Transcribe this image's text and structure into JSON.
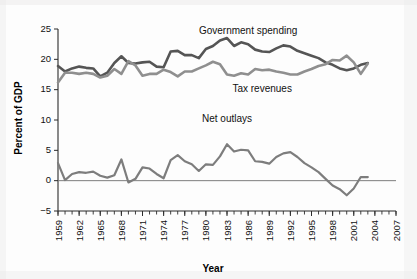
{
  "figure": {
    "background_color": "#fdfdfd",
    "series_colors": {
      "government_spending": "#555555",
      "tax_revenues": "#8f8f8f",
      "net_outlays": "#7d7d7d"
    },
    "axis_color": "#2b2b2b",
    "zero_line_color": "#7d7d7d"
  },
  "labels": {
    "government_spending": "Government spending",
    "tax_revenues": "Tax revenues",
    "net_outlays": "Net outlays",
    "xlabel": "Year",
    "ylabel": "Percent of GDP"
  },
  "axes": {
    "ytick_labels": [
      "25",
      "20",
      "15",
      "10",
      "5",
      "0",
      "−5"
    ],
    "ytick_values": [
      25,
      20,
      15,
      10,
      5,
      0,
      -5
    ],
    "xtick_labels": [
      "1959",
      "1962",
      "1965",
      "1968",
      "1971",
      "1974",
      "1977",
      "1980",
      "1983",
      "1986",
      "1989",
      "1992",
      "1995",
      "1998",
      "2001",
      "2004",
      "2007"
    ],
    "xtick_values": [
      1959,
      1962,
      1965,
      1968,
      1971,
      1974,
      1977,
      1980,
      1983,
      1986,
      1989,
      1992,
      1995,
      1998,
      2001,
      2004,
      2007
    ],
    "xlim": [
      1959,
      2007
    ],
    "ylim": [
      -5,
      25
    ],
    "minor_tick_step": 1
  },
  "chart_data": {
    "type": "line",
    "title": "",
    "xlabel": "Year",
    "ylabel": "Percent of GDP",
    "xlim": [
      1959,
      2007
    ],
    "ylim": [
      -5,
      25
    ],
    "grid": false,
    "legend_position": "inline-annotations",
    "x": [
      1959,
      1960,
      1961,
      1962,
      1963,
      1964,
      1965,
      1966,
      1967,
      1968,
      1969,
      1970,
      1971,
      1972,
      1973,
      1974,
      1975,
      1976,
      1977,
      1978,
      1979,
      1980,
      1981,
      1982,
      1983,
      1984,
      1985,
      1986,
      1987,
      1988,
      1989,
      1990,
      1991,
      1992,
      1993,
      1994,
      1995,
      1996,
      1997,
      1998,
      1999,
      2000,
      2001,
      2002,
      2003
    ],
    "series": [
      {
        "name": "Government spending",
        "color": "#555555",
        "values": [
          18.9,
          18.0,
          18.5,
          18.8,
          18.6,
          18.5,
          17.2,
          17.8,
          19.4,
          20.5,
          19.4,
          19.3,
          19.5,
          19.6,
          18.8,
          18.7,
          21.3,
          21.4,
          20.7,
          20.7,
          20.2,
          21.7,
          22.2,
          23.1,
          23.5,
          22.2,
          22.8,
          22.5,
          21.6,
          21.3,
          21.2,
          21.8,
          22.3,
          22.1,
          21.4,
          21.0,
          20.6,
          20.2,
          19.5,
          19.1,
          18.5,
          18.2,
          18.5,
          19.1,
          19.4
        ],
        "style": "solid",
        "linewidth": 2.6
      },
      {
        "name": "Tax revenues",
        "color": "#8f8f8f",
        "values": [
          16.2,
          17.8,
          17.8,
          17.6,
          17.8,
          17.6,
          17.0,
          17.3,
          18.4,
          17.6,
          19.7,
          19.0,
          17.3,
          17.6,
          17.6,
          18.3,
          17.9,
          17.2,
          18.0,
          18.0,
          18.5,
          19.0,
          19.6,
          19.2,
          17.5,
          17.3,
          17.7,
          17.5,
          18.4,
          18.2,
          18.3,
          18.0,
          17.8,
          17.5,
          17.5,
          18.0,
          18.4,
          18.9,
          19.2,
          19.9,
          19.8,
          20.6,
          19.5,
          17.6,
          19.3
        ],
        "style": "solid",
        "linewidth": 2.6
      },
      {
        "name": "Net outlays",
        "color": "#7d7d7d",
        "values": [
          2.9,
          0.1,
          1.1,
          1.4,
          1.3,
          1.5,
          0.8,
          0.5,
          0.9,
          3.5,
          -0.3,
          0.3,
          2.2,
          2.0,
          1.1,
          0.4,
          3.4,
          4.2,
          3.2,
          2.7,
          1.6,
          2.7,
          2.6,
          4.0,
          6.0,
          4.8,
          5.1,
          5.0,
          3.2,
          3.1,
          2.8,
          3.9,
          4.5,
          4.7,
          3.9,
          2.9,
          2.2,
          1.4,
          0.3,
          -0.8,
          -1.4,
          -2.4,
          -1.3,
          0.6,
          0.6
        ],
        "style": "solid",
        "linewidth": 2.2
      }
    ],
    "annotations": [
      {
        "text": "Government spending",
        "x": 1986,
        "y": 24.2
      },
      {
        "text": "Tax revenues",
        "x": 1988,
        "y": 14.6
      },
      {
        "text": "Net outlays",
        "x": 1983,
        "y": 9.7
      }
    ]
  }
}
